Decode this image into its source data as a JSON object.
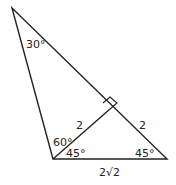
{
  "diagram": {
    "type": "geometry-triangle",
    "vertices": {
      "top": [
        12,
        8
      ],
      "bottom_left": [
        53,
        159
      ],
      "bottom_right": [
        167,
        159
      ],
      "altitude_foot": [
        110,
        109
      ]
    },
    "labels": {
      "angle_top": "30°",
      "angle_left_upper": "60°",
      "angle_left_lower": "45°",
      "angle_right": "45°",
      "altitude_length": "2",
      "right_segment": "2",
      "base_length": "2√2"
    },
    "colors": {
      "line": "#222222",
      "background": "#ffffff"
    }
  }
}
